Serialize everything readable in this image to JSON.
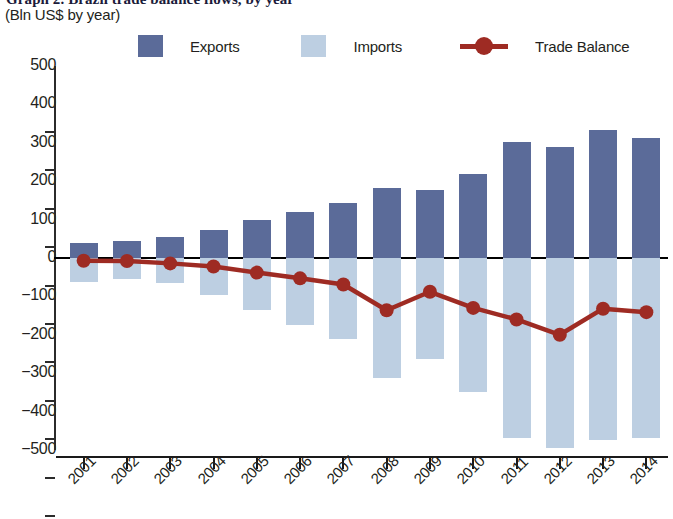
{
  "header": {
    "title_clipped": "Graph 2. Brazil trade balance flows, by year",
    "subtitle": "(Bln US$ by year)"
  },
  "legend": {
    "items": [
      {
        "label": "Exports",
        "icon": "square-swatch-icon",
        "color": "#5b6b99"
      },
      {
        "label": "Imports",
        "icon": "square-swatch-icon",
        "color": "#bdcfe2"
      },
      {
        "label": "Trade Balance",
        "icon": "line-marker-icon",
        "color": "#9e2b23"
      }
    ]
  },
  "colors": {
    "exports": "#5b6b99",
    "imports": "#bdcfe2",
    "trade_balance": "#9e2b23",
    "axis": "#1a1a1a",
    "text": "#231f20"
  },
  "chart_data": {
    "type": "bar",
    "title": "Graph 2. Brazil trade balance flows, by year",
    "subtitle": "(Bln US$ by year)",
    "xlabel": "",
    "ylabel": "Bln US$ by year",
    "ylim": [
      -500,
      500
    ],
    "yticks": [
      500,
      400,
      300,
      200,
      100,
      0,
      -100,
      -200,
      -300,
      -400,
      -500
    ],
    "ytick_labels": [
      "500",
      "400",
      "300",
      "200",
      "100",
      "0",
      "−100",
      "−200",
      "−300",
      "−400",
      "−500"
    ],
    "grid": false,
    "legend_position": "top",
    "categories": [
      "2001",
      "2002",
      "2003",
      "2004",
      "2005",
      "2006",
      "2007",
      "2008",
      "2009",
      "2010",
      "2011",
      "2012",
      "2013",
      "2014"
    ],
    "series": [
      {
        "name": "Exports",
        "type": "bar",
        "color": "#5b6b99",
        "values": [
          39,
          43,
          54,
          73,
          98,
          119,
          144,
          181,
          177,
          220,
          301,
          290,
          334,
          313
        ]
      },
      {
        "name": "Imports",
        "type": "bar",
        "color": "#bdcfe2",
        "values": [
          -62,
          -54,
          -65,
          -96,
          -135,
          -174,
          -211,
          -313,
          -263,
          -350,
          -468,
          -494,
          -474,
          -468
        ]
      },
      {
        "name": "Trade Balance",
        "type": "line",
        "color": "#9e2b23",
        "values": [
          -7,
          -8,
          -14,
          -22,
          -38,
          -53,
          -69,
          -136,
          -88,
          -130,
          -160,
          -200,
          -132,
          -141
        ]
      }
    ]
  }
}
